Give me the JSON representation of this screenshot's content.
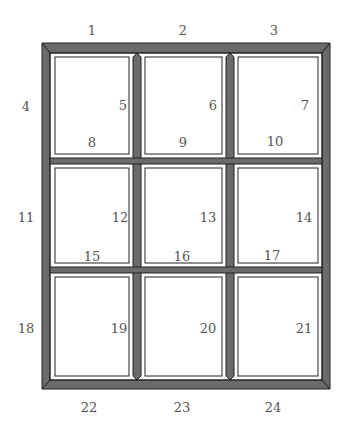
{
  "diagram": {
    "colors": {
      "bar": "#6b6b6b",
      "edge": "#222222",
      "highlight": "#ffffff",
      "label": "#555555"
    },
    "labels": [
      {
        "id": "1",
        "text": "1",
        "x": 92,
        "y": 30
      },
      {
        "id": "2",
        "text": "2",
        "x": 183,
        "y": 30
      },
      {
        "id": "3",
        "text": "3",
        "x": 274,
        "y": 30
      },
      {
        "id": "4",
        "text": "4",
        "x": 26,
        "y": 106
      },
      {
        "id": "5",
        "text": "5",
        "x": 123,
        "y": 105
      },
      {
        "id": "6",
        "text": "6",
        "x": 213,
        "y": 105
      },
      {
        "id": "7",
        "text": "7",
        "x": 305,
        "y": 105
      },
      {
        "id": "8",
        "text": "8",
        "x": 92,
        "y": 142
      },
      {
        "id": "9",
        "text": "9",
        "x": 183,
        "y": 142
      },
      {
        "id": "10",
        "text": "10",
        "x": 275,
        "y": 141
      },
      {
        "id": "11",
        "text": "11",
        "x": 26,
        "y": 217
      },
      {
        "id": "12",
        "text": "12",
        "x": 120,
        "y": 217
      },
      {
        "id": "13",
        "text": "13",
        "x": 208,
        "y": 217
      },
      {
        "id": "14",
        "text": "14",
        "x": 304,
        "y": 217
      },
      {
        "id": "15",
        "text": "15",
        "x": 92,
        "y": 256
      },
      {
        "id": "16",
        "text": "16",
        "x": 182,
        "y": 256
      },
      {
        "id": "17",
        "text": "17",
        "x": 272,
        "y": 255
      },
      {
        "id": "18",
        "text": "18",
        "x": 26,
        "y": 328
      },
      {
        "id": "19",
        "text": "19",
        "x": 119,
        "y": 328
      },
      {
        "id": "20",
        "text": "20",
        "x": 208,
        "y": 328
      },
      {
        "id": "21",
        "text": "21",
        "x": 304,
        "y": 328
      },
      {
        "id": "22",
        "text": "22",
        "x": 89,
        "y": 407
      },
      {
        "id": "23",
        "text": "23",
        "x": 182,
        "y": 407
      },
      {
        "id": "24",
        "text": "24",
        "x": 273,
        "y": 407
      }
    ]
  }
}
